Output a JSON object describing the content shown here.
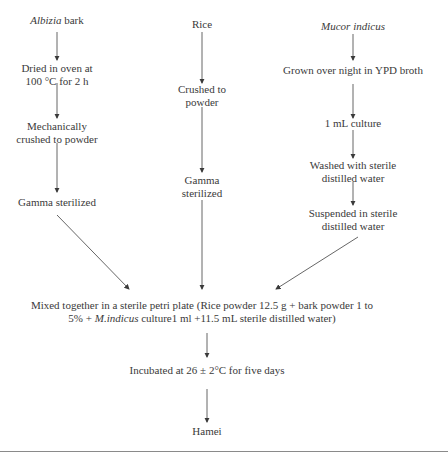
{
  "diagram": {
    "type": "flowchart",
    "columns": [
      {
        "id": "albizia",
        "steps": [
          {
            "italic": "Albizia",
            "text": " bark"
          },
          {
            "lines": [
              "Dried in oven at",
              "100 °C for 2 h"
            ]
          },
          {
            "lines": [
              "Mechanically",
              "crushed to powder"
            ]
          },
          {
            "lines": [
              "Gamma sterilized"
            ]
          }
        ]
      },
      {
        "id": "rice",
        "steps": [
          {
            "lines": [
              "Rice"
            ]
          },
          {
            "lines": [
              "Crushed to",
              "powder"
            ]
          },
          {
            "lines": [
              "Gamma",
              "sterilized"
            ]
          }
        ]
      },
      {
        "id": "mucor",
        "steps": [
          {
            "italic": "Mucor indicus",
            "text": ""
          },
          {
            "lines": [
              "Grown over night in YPD broth"
            ]
          },
          {
            "lines": [
              "1 mL culture"
            ]
          },
          {
            "lines": [
              "Washed with sterile",
              "distilled water"
            ]
          },
          {
            "lines": [
              "Suspended in sterile",
              "distilled water"
            ]
          }
        ]
      }
    ],
    "merge": {
      "line1": "Mixed together in a sterile petri plate (Rice powder 12.5 g + bark powder 1 to",
      "line2_pre": "5% + ",
      "line2_italic": "M.indicus",
      "line2_post": " culture1 ml +11.5 mL sterile distilled water)"
    },
    "incubate": "Incubated at 26 ± 2°C for five days",
    "result": "Hamei"
  }
}
